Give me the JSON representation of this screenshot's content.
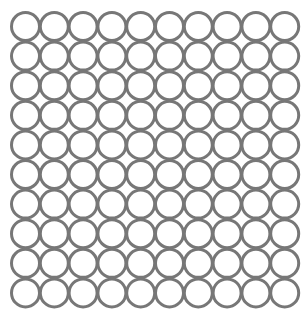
{
  "figure": {
    "rows": 10,
    "cols": 10,
    "circle": {
      "stroke_color": "#777777",
      "fill_color": "#ffffff",
      "radius": 14,
      "stroke_width": 3
    },
    "layout": {
      "origin_x": 25.5,
      "origin_y": 26.5,
      "pitch_x": 28.8,
      "pitch_y": 29.6
    }
  }
}
